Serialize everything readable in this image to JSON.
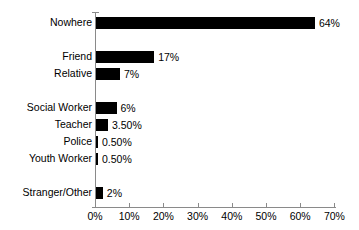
{
  "chart_data": {
    "type": "bar",
    "orientation": "horizontal",
    "title": "",
    "subtitle": "",
    "xlabel": "",
    "ylabel": "",
    "xlim": [
      0,
      70
    ],
    "grid": false,
    "legend": null,
    "bar_color": "#000000",
    "axis_color": "#8a8a8a",
    "categories": [
      "Nowhere",
      "Friend",
      "Relative",
      "Social Worker",
      "Teacher",
      "Police",
      "Youth Worker",
      "Stranger/Other"
    ],
    "values": [
      64,
      17,
      7,
      6,
      3.5,
      0.5,
      0.5,
      2
    ],
    "value_labels": [
      "64%",
      "17%",
      "7%",
      "6%",
      "3.50%",
      "0.50%",
      "0.50%",
      "2%"
    ],
    "xticks": [
      0,
      10,
      20,
      30,
      40,
      50,
      60,
      70
    ],
    "xtick_labels": [
      "0%",
      "10%",
      "20%",
      "30%",
      "40%",
      "50%",
      "60%",
      "70%"
    ],
    "group_breaks_after": [
      "Nowhere",
      "Relative",
      "Youth Worker"
    ]
  }
}
